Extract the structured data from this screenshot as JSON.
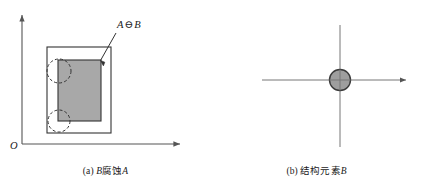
{
  "figure": {
    "panels": [
      {
        "id": "a",
        "caption_index": "(a)",
        "caption_var_lead": "B",
        "caption_cjk": "腐蚀",
        "caption_var_trail": "A",
        "caption_full": "(a) B腐蚀A",
        "origin_label": "O",
        "annotation": {
          "operand_left": "A",
          "operator": "⊖",
          "operand_right": "B",
          "text": "A ⊖ B"
        },
        "shapes": {
          "outer_rect": {
            "name": "set-A-boundary",
            "x": 47,
            "y": 47,
            "width": 64,
            "height": 86,
            "fill": "none",
            "stroke": "#333333"
          },
          "eroded_rect": {
            "name": "eroded-region",
            "x": 58,
            "y": 60,
            "width": 43,
            "height": 61,
            "fill": "#a8a8a8",
            "stroke": "#333333"
          },
          "dashed_circles": [
            {
              "name": "structuring-element-top",
              "cx": 59,
              "cy": 71,
              "r": 12,
              "stroke": "#333333",
              "dash": "3,2.2"
            },
            {
              "name": "structuring-element-bottom",
              "cx": 59,
              "cy": 121,
              "r": 11,
              "stroke": "#333333",
              "dash": "3,2.2"
            }
          ],
          "leader_line": {
            "name": "annotation-leader",
            "x1": 116,
            "y1": 33,
            "x2": 99,
            "y2": 62
          }
        },
        "axes": {
          "x_axis": {
            "name": "x-axis",
            "x1": 22,
            "y1": 144,
            "x2": 180,
            "y2": 144
          },
          "y_axis": {
            "name": "y-axis",
            "x1": 22,
            "y1": 144,
            "x2": 22,
            "y2": 15
          }
        }
      },
      {
        "id": "b",
        "caption_index": "(b)",
        "caption_cjk": "结构元素",
        "caption_var_trail": "B",
        "caption_full": "(b) 结构元素B",
        "element_label": "B",
        "shapes": {
          "disk": {
            "name": "structuring-element-disk",
            "cx": 340,
            "cy": 80,
            "r": 10.5,
            "fill": "#9e9e9e",
            "stroke": "#3a3a3a"
          }
        },
        "axes": {
          "x_axis": {
            "name": "x-axis",
            "x1": 262,
            "y1": 80,
            "x2": 408,
            "y2": 80
          },
          "y_axis": {
            "name": "y-axis",
            "x1": 340,
            "y1": 147,
            "x2": 340,
            "y2": 25
          }
        }
      }
    ],
    "colors": {
      "background": "#ffffff",
      "stroke": "#333333",
      "axis_stroke": "#555555",
      "fill_eroded": "#a8a8a8",
      "fill_disk": "#9e9e9e",
      "text": "#1a1a1a"
    }
  }
}
